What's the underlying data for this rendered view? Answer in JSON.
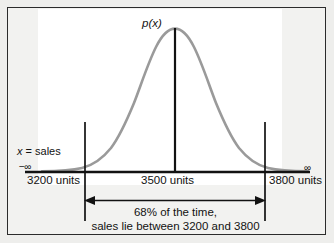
{
  "figure": {
    "type": "normal-distribution-diagram",
    "background_color": "#eeeeec",
    "panel_color": "#ffffff",
    "curve_color": "#9a9a9a",
    "line_color": "#121212"
  },
  "labels": {
    "density_label": "p(x)",
    "axis_label_prefix": "x",
    "axis_label_equals": " = sales",
    "axis_label_full": "x = sales",
    "neg_infinity": "−∞",
    "pos_infinity": "∞",
    "tick_left": "3200 units",
    "tick_center": "3500 units",
    "tick_right": "3800 units"
  },
  "caption": {
    "line1": "68% of the time,",
    "line2": "sales lie between 3200 and 3800"
  },
  "chart_data": {
    "type": "line",
    "title": "",
    "xlabel": "x = sales",
    "ylabel": "p(x)",
    "distribution": "normal",
    "mean": 3500,
    "std_dev": 300,
    "interval": {
      "lower": 3200,
      "upper": 3800,
      "probability_percent": 68,
      "description": "68% of the time, sales lie between 3200 and 3800"
    },
    "x_axis": {
      "min_label": "−∞",
      "max_label": "∞",
      "ticks": [
        {
          "value": 3200,
          "label": "3200 units"
        },
        {
          "value": 3500,
          "label": "3500 units"
        },
        {
          "value": 3800,
          "label": "3800 units"
        }
      ],
      "grid": false
    },
    "y_axis": {
      "label": "p(x)",
      "ticks": [],
      "grid": false
    },
    "legend": {
      "show": false,
      "position": "none"
    },
    "annotations": [
      {
        "name": "mean-line",
        "at": 3500,
        "type": "vertical-line"
      },
      {
        "name": "lower-bound-line",
        "at": 3200,
        "type": "vertical-line"
      },
      {
        "name": "upper-bound-line",
        "at": 3800,
        "type": "vertical-line"
      },
      {
        "name": "interval-arrow",
        "from": 3200,
        "to": 3800,
        "type": "double-arrow"
      }
    ]
  }
}
